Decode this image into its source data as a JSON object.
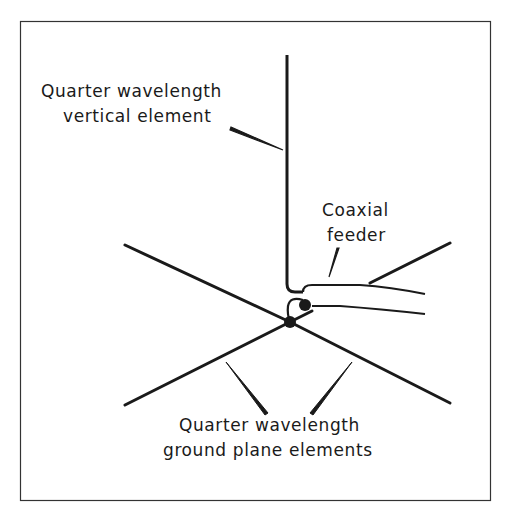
{
  "diagram": {
    "labels": {
      "vertical_line1": "Quarter wavelength",
      "vertical_line2": "vertical element",
      "coax_line1": "Coaxial",
      "coax_line2": "feeder",
      "ground_line1": "Quarter wavelength",
      "ground_line2": "ground plane elements"
    },
    "colors": {
      "stroke": "#1a1a1a",
      "background": "#ffffff",
      "frame": "#333333"
    }
  }
}
